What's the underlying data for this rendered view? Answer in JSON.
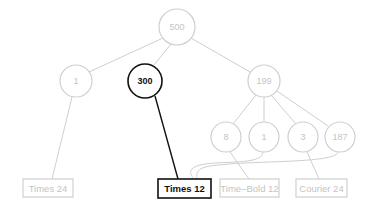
{
  "diagram": {
    "type": "tree",
    "colors": {
      "faded": "#cfcfcf",
      "faded_text": "#c4c4c4",
      "highlight": "#111111",
      "background": "#ffffff"
    },
    "nodes": {
      "root": {
        "label": "500"
      },
      "n1": {
        "label": "1"
      },
      "n300": {
        "label": "300",
        "highlighted": true
      },
      "n199": {
        "label": "199"
      },
      "n8": {
        "label": "8"
      },
      "n1b": {
        "label": "1"
      },
      "n3": {
        "label": "3"
      },
      "n187": {
        "label": "187"
      }
    },
    "leaves": {
      "times24": {
        "label": "Times 24"
      },
      "times12": {
        "label": "Times 12",
        "highlighted": true
      },
      "timebold12": {
        "label": "Time–Bold 12"
      },
      "courier24": {
        "label": "Courier 24"
      }
    },
    "edges": [
      [
        "root",
        "n1"
      ],
      [
        "root",
        "n300"
      ],
      [
        "root",
        "n199"
      ],
      [
        "n199",
        "n8"
      ],
      [
        "n199",
        "n1b"
      ],
      [
        "n199",
        "n3"
      ],
      [
        "n199",
        "n187"
      ],
      [
        "n1",
        "times24"
      ],
      [
        "n300",
        "times12"
      ],
      [
        "n8",
        "timebold12"
      ],
      [
        "n1b",
        "times12"
      ],
      [
        "n3",
        "courier24"
      ],
      [
        "n187",
        "times12"
      ]
    ]
  }
}
